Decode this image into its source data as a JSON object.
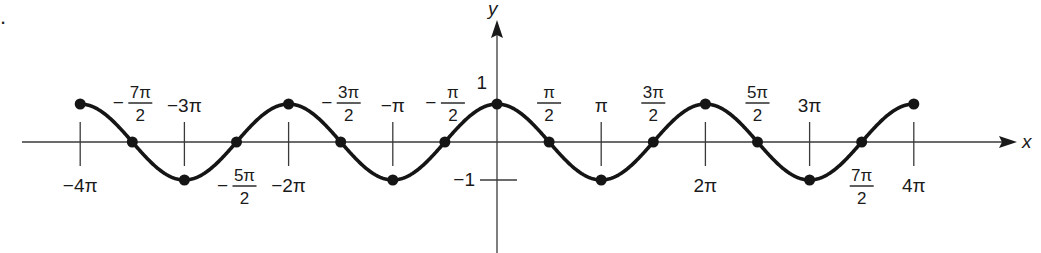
{
  "problem_number": ".",
  "chart_data": {
    "type": "line",
    "title": "",
    "function": "y = cos x",
    "xlabel": "x",
    "ylabel": "y",
    "xlim_pi": [
      -4,
      4
    ],
    "ylim": [
      -1,
      1
    ],
    "grid": false,
    "legend": "none",
    "x_values_pi": [
      -4,
      -3.5,
      -3,
      -2.5,
      -2,
      -1.5,
      -1,
      -0.5,
      0,
      0.5,
      1,
      1.5,
      2,
      2.5,
      3,
      3.5,
      4
    ],
    "points": [
      {
        "x_pi": -4,
        "y": 1
      },
      {
        "x_pi": -3.5,
        "y": 0
      },
      {
        "x_pi": -3,
        "y": -1
      },
      {
        "x_pi": -2.5,
        "y": 0
      },
      {
        "x_pi": -2,
        "y": 1
      },
      {
        "x_pi": -1.5,
        "y": 0
      },
      {
        "x_pi": -1,
        "y": -1
      },
      {
        "x_pi": -0.5,
        "y": 0
      },
      {
        "x_pi": 0,
        "y": 1
      },
      {
        "x_pi": 0.5,
        "y": 0
      },
      {
        "x_pi": 1,
        "y": -1
      },
      {
        "x_pi": 1.5,
        "y": 0
      },
      {
        "x_pi": 2,
        "y": 1
      },
      {
        "x_pi": 2.5,
        "y": 0
      },
      {
        "x_pi": 3,
        "y": -1
      },
      {
        "x_pi": 3.5,
        "y": 0
      },
      {
        "x_pi": 4,
        "y": 1
      }
    ],
    "x_tick_labels": [
      {
        "x_pi": -4,
        "text": "−4π",
        "side": "below"
      },
      {
        "x_pi": -3.5,
        "num": "7π",
        "den": "2",
        "sign": "−",
        "side": "above"
      },
      {
        "x_pi": -3,
        "text": "−3π",
        "side": "above"
      },
      {
        "x_pi": -2.5,
        "num": "5π",
        "den": "2",
        "sign": "−",
        "side": "below"
      },
      {
        "x_pi": -2,
        "text": "−2π",
        "side": "below"
      },
      {
        "x_pi": -1.5,
        "num": "3π",
        "den": "2",
        "sign": "−",
        "side": "above"
      },
      {
        "x_pi": -1,
        "text": "−π",
        "side": "above"
      },
      {
        "x_pi": -0.5,
        "num": "π",
        "den": "2",
        "sign": "−",
        "side": "above"
      },
      {
        "x_pi": 0.5,
        "num": "π",
        "den": "2",
        "sign": "",
        "side": "above"
      },
      {
        "x_pi": 1,
        "text": "π",
        "side": "above"
      },
      {
        "x_pi": 1.5,
        "num": "3π",
        "den": "2",
        "sign": "",
        "side": "above"
      },
      {
        "x_pi": 2,
        "text": "2π",
        "side": "below"
      },
      {
        "x_pi": 2.5,
        "num": "5π",
        "den": "2",
        "sign": "",
        "side": "above"
      },
      {
        "x_pi": 3,
        "text": "3π",
        "side": "above"
      },
      {
        "x_pi": 3.5,
        "num": "7π",
        "den": "2",
        "sign": "",
        "side": "below"
      },
      {
        "x_pi": 4,
        "text": "4π",
        "side": "below"
      }
    ],
    "y_tick_labels": [
      {
        "y": 1,
        "text": "1"
      },
      {
        "y": -1,
        "text": "−1"
      }
    ]
  }
}
